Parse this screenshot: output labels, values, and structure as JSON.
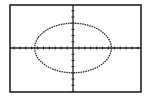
{
  "chart_data": {
    "type": "line",
    "title": "",
    "xlabel": "",
    "ylabel": "",
    "equation_form": "x^2/a^2 + y^2/b^2 = 1",
    "ellipse": {
      "center": [
        0,
        0
      ],
      "semi_major_x": 6.5,
      "semi_minor_y": 4
    },
    "xlim": [
      -10.5,
      11
    ],
    "ylim": [
      -7.5,
      7.5
    ],
    "tick_spacing": 1,
    "grid": false,
    "legend": "none",
    "axis_labels_shown": false
  },
  "colors": {
    "background": "#ffffff",
    "frame": "#222222",
    "axes": "#222222",
    "curve": "#333333"
  },
  "window": {
    "frame": {
      "x": 10,
      "y": 5,
      "w": 131,
      "h": 87
    },
    "origin_px": {
      "x": 73,
      "y": 48
    },
    "px_per_unit_x": 5.9,
    "px_per_unit_y": 6.2
  }
}
